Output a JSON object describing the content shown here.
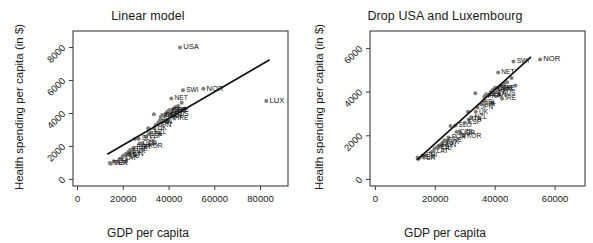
{
  "figure": {
    "width": 593,
    "height": 243,
    "background": "#ffffff",
    "point_color": "#7e7e7e",
    "line_color": "#111111",
    "axis_color": "#3d3d3d"
  },
  "chart_data": [
    {
      "type": "scatter",
      "panel": "left",
      "title": "Linear model",
      "xlabel": "GDP per capita",
      "ylabel": "Health spending per capita (in $)",
      "xlim": [
        -2000,
        92000
      ],
      "ylim": [
        -400,
        9000
      ],
      "xticks": [
        0,
        20000,
        40000,
        60000,
        80000
      ],
      "xticklabels": [
        "0",
        "20000",
        "40000",
        "60000",
        "80000"
      ],
      "yticks": [
        0,
        2000,
        4000,
        6000,
        8000
      ],
      "yticklabels": [
        "0",
        "2000",
        "4000",
        "6000",
        "8000"
      ],
      "grid": false,
      "legend": null,
      "trendline": {
        "label": "linear fit",
        "x": [
          13000,
          84000
        ],
        "y": [
          1520,
          7250
        ]
      },
      "points": [
        {
          "label": "MEX",
          "x": 14100,
          "y": 1000
        },
        {
          "label": "TUR",
          "x": 14500,
          "y": 950
        },
        {
          "label": "CHI",
          "x": 15800,
          "y": 1100
        },
        {
          "label": "POL",
          "x": 19800,
          "y": 1420
        },
        {
          "label": "EST",
          "x": 20600,
          "y": 1470
        },
        {
          "label": "LAT",
          "x": 19400,
          "y": 1300
        },
        {
          "label": "HUN",
          "x": 21200,
          "y": 1550
        },
        {
          "label": "SVK",
          "x": 22500,
          "y": 1700
        },
        {
          "label": "GRE",
          "x": 23100,
          "y": 1800
        },
        {
          "label": "POR",
          "x": 24400,
          "y": 1920
        },
        {
          "label": "KOR",
          "x": 29500,
          "y": 1990
        },
        {
          "label": "ISR",
          "x": 28500,
          "y": 2120
        },
        {
          "label": "CZE",
          "x": 27100,
          "y": 2170
        },
        {
          "label": "SLO",
          "x": 26700,
          "y": 2470
        },
        {
          "label": "ESP",
          "x": 29900,
          "y": 2600
        },
        {
          "label": "ITA",
          "x": 31100,
          "y": 2750
        },
        {
          "label": "NZL",
          "x": 32000,
          "y": 2850
        },
        {
          "label": "UK",
          "x": 33500,
          "y": 3100
        },
        {
          "label": "JPN",
          "x": 34100,
          "y": 3300
        },
        {
          "label": "FIN",
          "x": 35300,
          "y": 3450
        },
        {
          "label": "ISL",
          "x": 35900,
          "y": 3550
        },
        {
          "label": "FRA",
          "x": 36400,
          "y": 3800
        },
        {
          "label": "BEL",
          "x": 37000,
          "y": 3900
        },
        {
          "label": "CAN",
          "x": 38100,
          "y": 3850
        },
        {
          "label": "AUT",
          "x": 39200,
          "y": 4100
        },
        {
          "label": "DEN",
          "x": 39800,
          "y": 4150
        },
        {
          "label": "GER",
          "x": 40100,
          "y": 4200
        },
        {
          "label": "SWE",
          "x": 40600,
          "y": 4200
        },
        {
          "label": "AUS",
          "x": 41200,
          "y": 3950
        },
        {
          "label": "IRE",
          "x": 42300,
          "y": 3700
        },
        {
          "label": "NET",
          "x": 41000,
          "y": 4900
        },
        {
          "label": "SWI",
          "x": 46100,
          "y": 5400
        },
        {
          "label": "NOR",
          "x": 55000,
          "y": 5500
        },
        {
          "label": "USA",
          "x": 44800,
          "y": 8000
        },
        {
          "label": "LUX",
          "x": 82500,
          "y": 4750
        },
        {
          "label": "",
          "x": 30900,
          "y": 3100
        },
        {
          "label": "",
          "x": 33400,
          "y": 3950
        },
        {
          "label": "",
          "x": 25100,
          "y": 2450
        },
        {
          "label": "",
          "x": 28100,
          "y": 2200
        },
        {
          "label": "",
          "x": 36300,
          "y": 3650
        },
        {
          "label": "",
          "x": 38500,
          "y": 4000
        },
        {
          "label": "",
          "x": 43000,
          "y": 4400
        },
        {
          "label": "",
          "x": 44000,
          "y": 4450
        },
        {
          "label": "",
          "x": 41900,
          "y": 4300
        },
        {
          "label": "",
          "x": 22000,
          "y": 1600
        },
        {
          "label": "",
          "x": 23800,
          "y": 1750
        },
        {
          "label": "",
          "x": 18600,
          "y": 1250
        },
        {
          "label": "",
          "x": 45500,
          "y": 4650
        },
        {
          "label": "",
          "x": 46800,
          "y": 4300
        },
        {
          "label": "",
          "x": 39000,
          "y": 3500
        }
      ]
    },
    {
      "type": "scatter",
      "panel": "right",
      "title": "Drop USA and Luxembourg",
      "xlabel": "GDP per capita",
      "ylabel": "Health spending per capita (in $)",
      "xlim": [
        -1800,
        70000
      ],
      "ylim": [
        -300,
        6800
      ],
      "xticks": [
        0,
        20000,
        40000,
        60000
      ],
      "xticklabels": [
        "0",
        "20000",
        "40000",
        "60000"
      ],
      "yticks": [
        0,
        2000,
        4000,
        6000
      ],
      "yticklabels": [
        "0",
        "2000",
        "4000",
        "6000"
      ],
      "grid": false,
      "legend": null,
      "trendline": {
        "label": "linear fit",
        "x": [
          13800,
          52000
        ],
        "y": [
          880,
          5620
        ]
      },
      "points": [
        {
          "label": "MEX",
          "x": 14100,
          "y": 1000
        },
        {
          "label": "TUR",
          "x": 14500,
          "y": 950
        },
        {
          "label": "CHI",
          "x": 15800,
          "y": 1100
        },
        {
          "label": "POL",
          "x": 19800,
          "y": 1420
        },
        {
          "label": "EST",
          "x": 20600,
          "y": 1470
        },
        {
          "label": "LAT",
          "x": 19400,
          "y": 1300
        },
        {
          "label": "HUN",
          "x": 21200,
          "y": 1550
        },
        {
          "label": "SVK",
          "x": 22500,
          "y": 1700
        },
        {
          "label": "GRE",
          "x": 23100,
          "y": 1800
        },
        {
          "label": "POR",
          "x": 24400,
          "y": 1920
        },
        {
          "label": "KOR",
          "x": 29500,
          "y": 1990
        },
        {
          "label": "ISR",
          "x": 28500,
          "y": 2120
        },
        {
          "label": "CZE",
          "x": 27100,
          "y": 2170
        },
        {
          "label": "SLO",
          "x": 26700,
          "y": 2470
        },
        {
          "label": "ESP",
          "x": 29900,
          "y": 2600
        },
        {
          "label": "ITA",
          "x": 31100,
          "y": 2750
        },
        {
          "label": "NZL",
          "x": 32000,
          "y": 2850
        },
        {
          "label": "UK",
          "x": 33500,
          "y": 3100
        },
        {
          "label": "JPN",
          "x": 34100,
          "y": 3300
        },
        {
          "label": "FIN",
          "x": 35300,
          "y": 3450
        },
        {
          "label": "ISL",
          "x": 35900,
          "y": 3550
        },
        {
          "label": "FRA",
          "x": 36400,
          "y": 3800
        },
        {
          "label": "BEL",
          "x": 37000,
          "y": 3900
        },
        {
          "label": "CAN",
          "x": 38100,
          "y": 3850
        },
        {
          "label": "AUT",
          "x": 39200,
          "y": 4100
        },
        {
          "label": "DEN",
          "x": 39800,
          "y": 4150
        },
        {
          "label": "GER",
          "x": 40100,
          "y": 4200
        },
        {
          "label": "SWE",
          "x": 40600,
          "y": 4200
        },
        {
          "label": "AUS",
          "x": 41200,
          "y": 3950
        },
        {
          "label": "IRE",
          "x": 42300,
          "y": 3700
        },
        {
          "label": "NET",
          "x": 41000,
          "y": 4900
        },
        {
          "label": "SWI",
          "x": 46100,
          "y": 5400
        },
        {
          "label": "NOR",
          "x": 55000,
          "y": 5500
        },
        {
          "label": "",
          "x": 30900,
          "y": 3100
        },
        {
          "label": "",
          "x": 33400,
          "y": 3950
        },
        {
          "label": "",
          "x": 25100,
          "y": 2450
        },
        {
          "label": "",
          "x": 28100,
          "y": 2200
        },
        {
          "label": "",
          "x": 36300,
          "y": 3650
        },
        {
          "label": "",
          "x": 38500,
          "y": 4000
        },
        {
          "label": "",
          "x": 43000,
          "y": 4400
        },
        {
          "label": "",
          "x": 44000,
          "y": 4450
        },
        {
          "label": "",
          "x": 41900,
          "y": 4300
        },
        {
          "label": "",
          "x": 22000,
          "y": 1600
        },
        {
          "label": "",
          "x": 23800,
          "y": 1750
        },
        {
          "label": "",
          "x": 18600,
          "y": 1250
        },
        {
          "label": "",
          "x": 45500,
          "y": 4650
        },
        {
          "label": "",
          "x": 46800,
          "y": 4300
        },
        {
          "label": "",
          "x": 39000,
          "y": 3500
        }
      ]
    }
  ]
}
